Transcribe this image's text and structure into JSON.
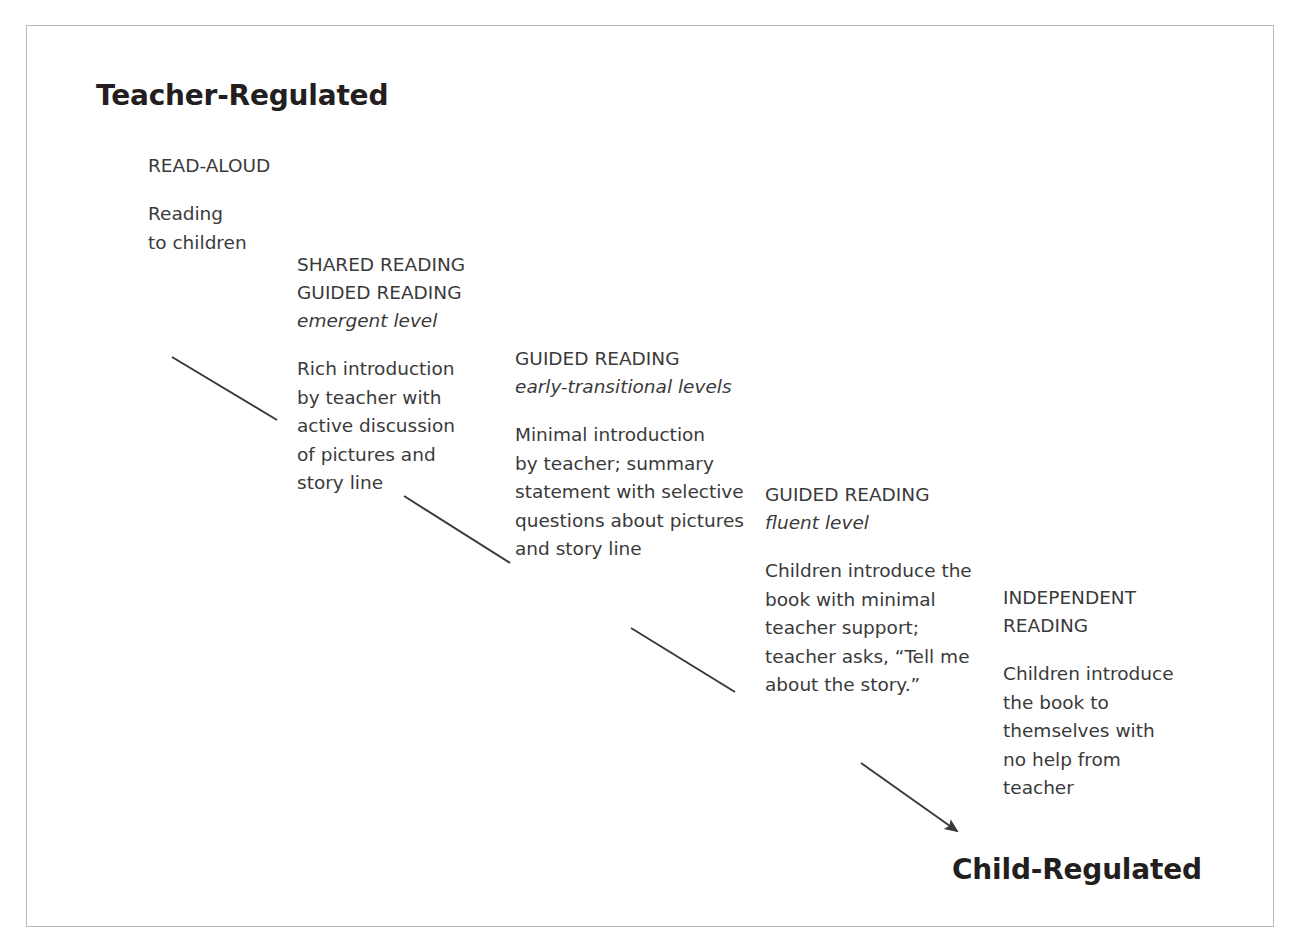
{
  "poles": {
    "start": "Teacher-Regulated",
    "end": "Child-Regulated"
  },
  "stages": [
    {
      "id": "read-aloud",
      "heading": "READ-ALOUD",
      "level": "",
      "body": [
        "Reading",
        "to children"
      ]
    },
    {
      "id": "shared-guided",
      "heading": "SHARED READING",
      "heading2": "GUIDED READING",
      "level": "emergent level",
      "body": [
        "Rich introduction",
        "by teacher with",
        "active discussion",
        "of pictures and",
        "story line"
      ]
    },
    {
      "id": "guided-early",
      "heading": "GUIDED READING",
      "level": "early-transitional levels",
      "body": [
        "Minimal introduction",
        "by teacher; summary",
        "statement with selective",
        "questions about pictures",
        "and story line"
      ]
    },
    {
      "id": "guided-fluent",
      "heading": "GUIDED READING",
      "level": "fluent level",
      "body": [
        "Children introduce the",
        "book with minimal",
        "teacher support;",
        "teacher asks, “Tell me",
        "about the story.”"
      ]
    },
    {
      "id": "independent",
      "heading": "INDEPENDENT",
      "heading2": "READING",
      "level": "",
      "body": [
        "Children introduce",
        "the book to",
        "themselves with",
        "no help from",
        "teacher"
      ]
    }
  ],
  "connectors": [
    {
      "name": "connector-1",
      "x1": 172,
      "y1": 357,
      "x2": 277,
      "y2": 420,
      "arrowhead": false
    },
    {
      "name": "connector-2",
      "x1": 404,
      "y1": 496,
      "x2": 510,
      "y2": 563,
      "arrowhead": false
    },
    {
      "name": "connector-3",
      "x1": 631,
      "y1": 628,
      "x2": 735,
      "y2": 692,
      "arrowhead": false
    },
    {
      "name": "connector-4-arrow",
      "x1": 861,
      "y1": 763,
      "x2": 957,
      "y2": 831,
      "arrowhead": true
    }
  ],
  "colors": {
    "text": "#231f20",
    "body_text": "#3a3a3a",
    "line": "#3a3a3a",
    "border": "#b9b9b9",
    "background": "#ffffff"
  }
}
